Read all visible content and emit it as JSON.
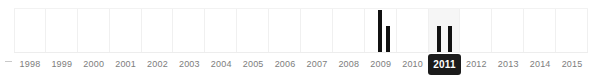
{
  "widget": {
    "name": "publication-year-timeline-filter",
    "selected_year": "2011",
    "edge_marker": "…"
  },
  "colors": {
    "bar": "#111111",
    "gridline": "#f0f0f0",
    "selected_column": "#f6f6f6",
    "selected_badge_bg": "#1b1b1b",
    "selected_badge_text": "#ffffff",
    "label_text": "#7d7d7d",
    "baseline": "#ededed"
  },
  "chart_data": {
    "type": "bar",
    "title": "",
    "xlabel": "",
    "ylabel": "",
    "grid": true,
    "legend": "none",
    "ylim": [
      0,
      3
    ],
    "categories": [
      "1998",
      "1999",
      "2000",
      "2001",
      "2002",
      "2003",
      "2004",
      "2005",
      "2006",
      "2007",
      "2008",
      "2009",
      "2010",
      "2011",
      "2012",
      "2013",
      "2014",
      "2015"
    ],
    "values": [
      0,
      0,
      0,
      0,
      0,
      0,
      0,
      0,
      0,
      0,
      0,
      3,
      0,
      2,
      0,
      0,
      0,
      0
    ],
    "bars": [
      {
        "year": "2009",
        "value": 3,
        "height_px": 43,
        "offset_in_cell": 0.42
      },
      {
        "year": "2009",
        "value": 2,
        "height_px": 27,
        "offset_in_cell": 0.66
      },
      {
        "year": "2011",
        "value": 2,
        "height_px": 27,
        "offset_in_cell": 0.25
      },
      {
        "year": "2011",
        "value": 2,
        "height_px": 27,
        "offset_in_cell": 0.62
      }
    ],
    "selected_category": "2011"
  }
}
